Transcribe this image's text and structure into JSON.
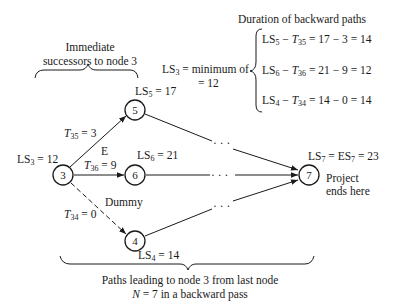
{
  "title_top_left": [
    "Immediate",
    "successors to node 3"
  ],
  "title_top_right": "Duration of backward paths",
  "ls3_formula": {
    "lhs": "LS",
    "lhs_sub": "3",
    "text": " = minimum of",
    "result": "= 12"
  },
  "backward_paths": [
    {
      "ls": "LS",
      "ls_sub": "5",
      "t": "T",
      "t_sub": "35",
      "rest": " = 17 − 3 = 14"
    },
    {
      "ls": "LS",
      "ls_sub": "6",
      "t": "T",
      "t_sub": "36",
      "rest": " = 21 − 9 = 12"
    },
    {
      "ls": "LS",
      "ls_sub": "4",
      "t": "T",
      "t_sub": "34",
      "rest": " = 14 − 0 = 14"
    }
  ],
  "nodes": [
    {
      "id": "3",
      "label_main": "LS",
      "label_sub": "3",
      "label_rest": " = 12"
    },
    {
      "id": "5",
      "label_main": "LS",
      "label_sub": "5",
      "label_rest": " = 17"
    },
    {
      "id": "6",
      "label_main": "LS",
      "label_sub": "6",
      "label_rest": " = 21"
    },
    {
      "id": "4",
      "label_main": "LS",
      "label_sub": "4",
      "label_rest": " = 14"
    },
    {
      "id": "7",
      "label_main": "LS",
      "label_sub": "7",
      "label_mid": " = ES",
      "label_sub2": "7",
      "label_rest": " = 23"
    }
  ],
  "edges": [
    {
      "from": "3",
      "to": "5",
      "label": "T",
      "label_sub": "35",
      "label_rest": " = 3",
      "activity": "E"
    },
    {
      "from": "3",
      "to": "6",
      "label": "T",
      "label_sub": "36",
      "label_rest": " = 9"
    },
    {
      "from": "3",
      "to": "4",
      "label": "T",
      "label_sub": "34",
      "label_rest": " = 0",
      "activity": "Dummy",
      "dashed": true
    }
  ],
  "ellipsis": "· · ·",
  "project_end": [
    "Project",
    "ends here"
  ],
  "bottom_caption": [
    "Paths leading to node 3 from last node",
    "N = 7 in a backward pass"
  ],
  "bottom_caption_n": "N",
  "bottom_caption_rest": " = 7 in a backward pass"
}
